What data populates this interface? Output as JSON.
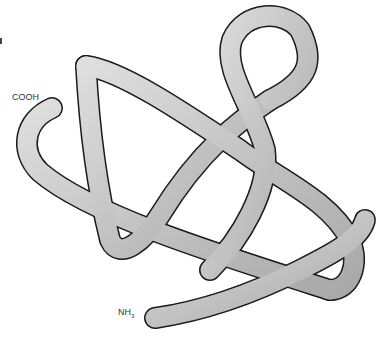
{
  "diagram": {
    "type": "protein tertiary structure ribbon illustration",
    "labels": {
      "c_terminus": "COOH",
      "n_terminus_base": "NH",
      "n_terminus_sub": "3"
    },
    "colors": {
      "ribbon_fill": "#b8b8b8",
      "ribbon_highlight": "#dcdcdc",
      "ribbon_outline": "#1a1a1a",
      "background": "#ffffff"
    }
  }
}
